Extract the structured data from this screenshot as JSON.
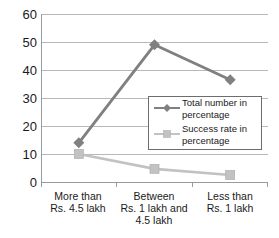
{
  "chart_data": {
    "type": "line",
    "title": "",
    "xlabel": "",
    "ylabel": "",
    "ylim": [
      0,
      60
    ],
    "yticks": [
      0,
      10,
      20,
      30,
      40,
      50,
      60
    ],
    "grid": true,
    "legend_position": "center-right",
    "categories": [
      "More than\nRs. 4.5 lakh",
      "Between\nRs. 1 lakh and\n4.5 lakh",
      "Less than\nRs. 1 lakh"
    ],
    "category_lines": [
      [
        "More than",
        "Rs. 4.5 lakh"
      ],
      [
        "Between",
        "Rs. 1 lakh and",
        "4.5 lakh"
      ],
      [
        "Less than",
        "Rs. 1 lakh"
      ]
    ],
    "series": [
      {
        "name": "Total number in percentage",
        "name_lines": [
          "Total number in",
          "percentage"
        ],
        "color": "#808080",
        "marker": "diamond",
        "values": [
          14,
          49,
          36.5
        ]
      },
      {
        "name": "Success rate in percentage",
        "name_lines": [
          "Success rate in",
          "percentage"
        ],
        "color": "#c2c2c2",
        "marker": "square",
        "values": [
          10,
          4.7,
          2.5
        ]
      }
    ]
  },
  "axes": {
    "y_tick_labels": [
      "60",
      "50",
      "40",
      "30",
      "20",
      "10",
      "0"
    ],
    "grid_color": "#b8b8b8",
    "axis_color": "#9a9a9a"
  },
  "legend": {
    "entries": [
      {
        "label_line1": "Total number in",
        "label_line2": "percentage",
        "color": "#808080"
      },
      {
        "label_line1": "Success rate in",
        "label_line2": "percentage",
        "color": "#c2c2c2"
      }
    ]
  }
}
